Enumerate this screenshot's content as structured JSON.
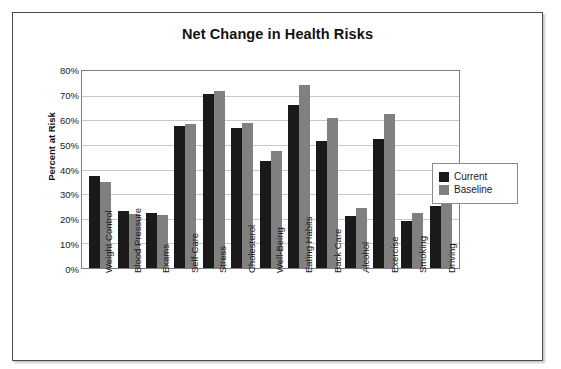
{
  "chart_data": {
    "type": "bar",
    "title": "Net Change in Health Risks",
    "xlabel": "",
    "ylabel": "Percent at Risk",
    "ylim": [
      0,
      80
    ],
    "ytick_labels": [
      "80%",
      "70%",
      "60%",
      "50%",
      "40%",
      "30%",
      "20%",
      "10%",
      "0%"
    ],
    "ytick_values": [
      80,
      70,
      60,
      50,
      40,
      30,
      20,
      10,
      0
    ],
    "grid": true,
    "legend_position": "right",
    "categories": [
      "Weight Control",
      "Blood Pressure",
      "Exams",
      "Self-Care",
      "Stress",
      "Cholesterol",
      "Well-Being",
      "Eating Habits",
      "Back Care",
      "Alcohol",
      "Exercise",
      "Smoking",
      "Driving"
    ],
    "series": [
      {
        "name": "Current",
        "color": "#1a1a1a",
        "values": [
          37.5,
          23,
          22.5,
          57.5,
          70.5,
          57,
          43.5,
          66,
          51.5,
          21,
          52.5,
          19,
          25
        ]
      },
      {
        "name": "Baseline",
        "color": "#808080",
        "values": [
          35,
          22,
          21.5,
          58.5,
          72,
          59,
          47.5,
          74.5,
          61,
          24.5,
          62.5,
          22.5,
          38.5
        ]
      }
    ]
  },
  "legend": {
    "items": [
      {
        "label": "Current",
        "color": "#1a1a1a"
      },
      {
        "label": "Baseline",
        "color": "#808080"
      }
    ]
  }
}
